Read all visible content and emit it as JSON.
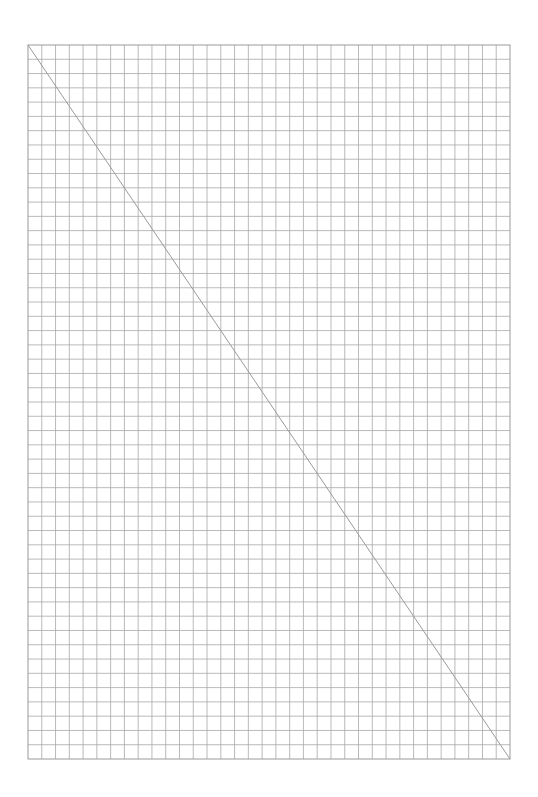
{
  "page": {
    "background": "#ffffff"
  },
  "grid": {
    "left": 28,
    "top": 45,
    "right": 510,
    "bottom": 759,
    "columns": 35,
    "rows": 50,
    "line_color": "#a8a8a8",
    "border_color": "#9a9a9a"
  },
  "diagonal": {
    "from": [
      28,
      45
    ],
    "to": [
      510,
      759
    ],
    "color": "#9a9a9a"
  }
}
